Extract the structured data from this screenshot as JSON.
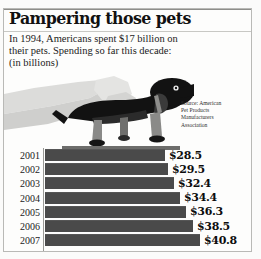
{
  "headline": {
    "title": "Pampering those pets",
    "deck_lines": [
      "In 1994, Americans spent $17 billion on",
      "their pets. Spending so far this decade:",
      "(in billions)"
    ]
  },
  "source": {
    "lines": [
      "Source: American",
      "Pet Products",
      "Manufacturers",
      "Association"
    ]
  },
  "illustration": {
    "name": "hand-petting-dachshund",
    "description": "Grayscale illustration of a hand petting a dachshund standing on a ledge"
  },
  "colors": {
    "bar": "#4a4a4a",
    "axis": "#9a9a96",
    "frame": "#b9b9b6",
    "text": "#111111",
    "background": "#fdfdfc"
  },
  "chart_data": {
    "type": "bar",
    "orientation": "horizontal",
    "title": "Pampering those pets",
    "subtitle": "In 1994, Americans spent $17 billion on their pets. Spending so far this decade:",
    "xlabel": "",
    "ylabel": "",
    "units": "billions of U.S. dollars",
    "unit_note": "(in billions)",
    "grid": false,
    "legend": "none",
    "source": "Source: American Pet Products Manufacturers Association",
    "categories": [
      "2001",
      "2002",
      "2003",
      "2004",
      "2005",
      "2006",
      "2007"
    ],
    "values": [
      28.5,
      29.5,
      32.4,
      34.4,
      36.3,
      38.5,
      40.8
    ],
    "labels": [
      "$28.5",
      "$29.5",
      "$32.4",
      "$34.4",
      "$36.3",
      "$38.5",
      "$40.8"
    ],
    "xlim": [
      0,
      40.8
    ],
    "bar_pixel_widths": [
      120,
      123,
      129,
      135,
      141,
      148,
      155
    ]
  }
}
